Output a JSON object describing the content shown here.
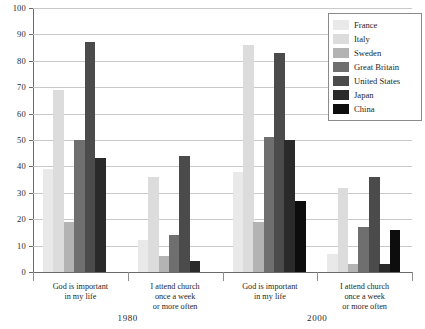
{
  "title_partial": "",
  "axis": {
    "ylabel": "Percent",
    "yticks": [
      "0",
      "10",
      "20",
      "30",
      "40",
      "50",
      "60",
      "70",
      "80",
      "90",
      "100"
    ],
    "ymin": 0,
    "ymax": 100
  },
  "legend": {
    "entries": [
      {
        "label": "France",
        "color": "#e9e9e9"
      },
      {
        "label": "Italy",
        "color": "#dcdcdc"
      },
      {
        "label": "Sweden",
        "color": "#b3b3b3"
      },
      {
        "label": "Great Britain",
        "color": "#6f6f6f"
      },
      {
        "label": "United States",
        "color": "#4b4b4b"
      },
      {
        "label": "Japan",
        "color": "#2a2a2a"
      },
      {
        "label": "China",
        "color": "#0d0d0d"
      }
    ]
  },
  "groups": [
    {
      "id": "g1",
      "label_lines": [
        "God is important",
        "in my life"
      ],
      "era": "1980"
    },
    {
      "id": "g2",
      "label_lines": [
        "I attend church",
        "once a week",
        "or more often"
      ],
      "era": "1980"
    },
    {
      "id": "g3",
      "label_lines": [
        "God is important",
        "in my life"
      ],
      "era": "2000"
    },
    {
      "id": "g4",
      "label_lines": [
        "I attend church",
        "once a week",
        "or more often"
      ],
      "era": "2000"
    }
  ],
  "eras": [
    {
      "label": "1980"
    },
    {
      "label": "2000"
    }
  ],
  "chart_data": {
    "type": "bar",
    "title": "",
    "xlabel": "",
    "ylabel": "Percent",
    "ylim": [
      0,
      100
    ],
    "grid": true,
    "legend_position": "top-right",
    "categories": [
      "God is important in my life (1980)",
      "I attend church once a week or more often (1980)",
      "God is important in my life (2000)",
      "I attend church once a week or more often (2000)"
    ],
    "series": [
      {
        "name": "France",
        "color": "#e9e9e9",
        "values": [
          39,
          12,
          38,
          7
        ]
      },
      {
        "name": "Italy",
        "color": "#dcdcdc",
        "values": [
          69,
          36,
          86,
          32
        ]
      },
      {
        "name": "Sweden",
        "color": "#b3b3b3",
        "values": [
          19,
          6,
          19,
          3
        ]
      },
      {
        "name": "Great Britain",
        "color": "#6f6f6f",
        "values": [
          50,
          14,
          51,
          17
        ]
      },
      {
        "name": "United States",
        "color": "#4b4b4b",
        "values": [
          87,
          44,
          83,
          36
        ]
      },
      {
        "name": "Japan",
        "color": "#2a2a2a",
        "values": [
          43,
          4,
          50,
          3
        ]
      },
      {
        "name": "China",
        "color": "#0d0d0d",
        "values": [
          0,
          0,
          27,
          16
        ]
      }
    ]
  }
}
